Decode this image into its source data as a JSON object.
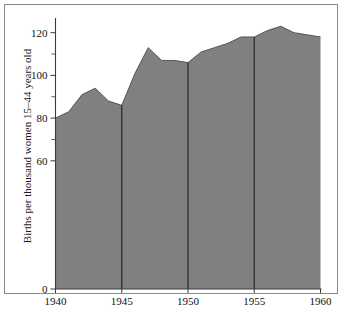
{
  "chart_data": {
    "type": "area",
    "title": "",
    "subtitle": "",
    "xlabel": "",
    "ylabel": "Births per thousand women 15–44 years old",
    "x": [
      1940,
      1941,
      1942,
      1943,
      1944,
      1945,
      1946,
      1947,
      1948,
      1949,
      1950,
      1951,
      1952,
      1953,
      1954,
      1955,
      1956,
      1957,
      1958,
      1959,
      1960
    ],
    "values": [
      80,
      83,
      91,
      94,
      88,
      86,
      101,
      113,
      107,
      107,
      106,
      111,
      113,
      115,
      118,
      118,
      121,
      123,
      120,
      119,
      118
    ],
    "series": [
      {
        "name": "Births per thousand women 15–44 years old",
        "values": [
          80,
          83,
          91,
          94,
          88,
          86,
          101,
          113,
          107,
          107,
          106,
          111,
          113,
          115,
          118,
          118,
          121,
          123,
          120,
          119,
          118
        ]
      }
    ],
    "xlim": [
      1940,
      1960
    ],
    "ylim": [
      0,
      125
    ],
    "x_ticks": [
      1940,
      1945,
      1950,
      1955,
      1960
    ],
    "x_tick_labels": [
      "1940",
      "1945",
      "1950",
      "1955",
      "1960"
    ],
    "y_ticks": [
      0,
      60,
      80,
      100,
      120
    ],
    "y_tick_labels": [
      "0",
      "60",
      "80",
      "100",
      "120"
    ],
    "y_minor_ticks": [
      70,
      90,
      110
    ],
    "grid": false,
    "legend": "none",
    "vertical_dividers": [
      1945,
      1950,
      1955
    ],
    "fill_color": "#808080",
    "divider_color": "#262626",
    "axis_color": "#3a3a3a",
    "background_color": "#ffffff"
  },
  "figure": {
    "frame_border_color": "#8a8a8a"
  }
}
